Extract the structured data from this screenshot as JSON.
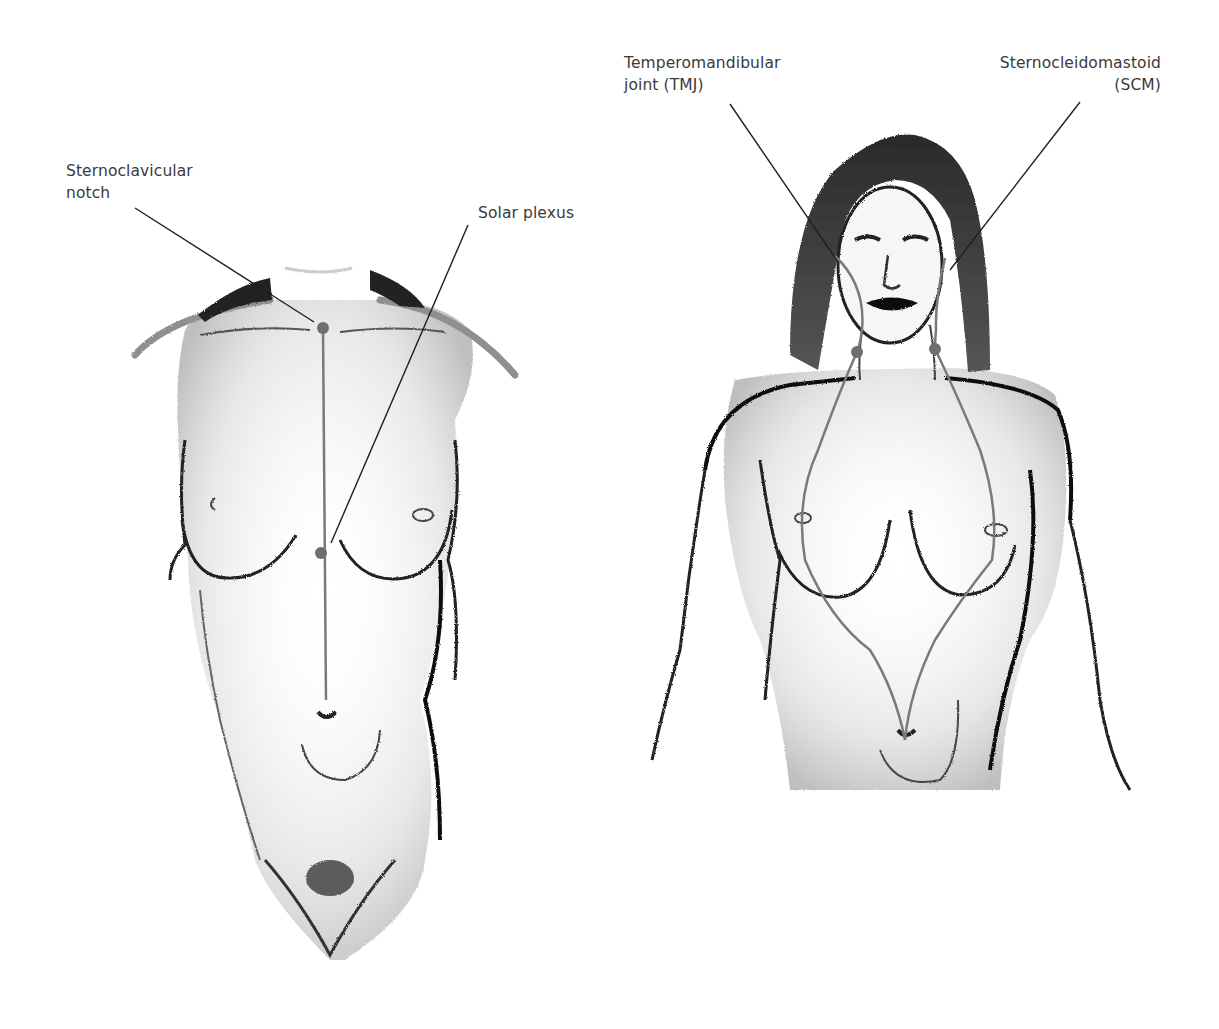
{
  "diagram": {
    "title": "",
    "figures": [
      {
        "id": "torso-front",
        "description": "Front view of a female torso, neck to pelvis",
        "labels": [
          {
            "id": "sternoclavicular-notch",
            "lines": [
              "Sternoclavicular",
              "notch"
            ]
          },
          {
            "id": "solar-plexus",
            "lines": [
              "Solar plexus"
            ]
          }
        ],
        "markers": [
          {
            "id": "notch-dot",
            "x": 323,
            "y": 328
          },
          {
            "id": "solar-plexus-dot",
            "x": 321,
            "y": 553
          }
        ],
        "meridian_line": "vertical line from sternoclavicular notch down past solar plexus to navel"
      },
      {
        "id": "head-torso-front",
        "description": "Front view of a woman with long hair, head to lower abdomen",
        "labels": [
          {
            "id": "tmj",
            "lines": [
              "Temperomandibular",
              "joint (TMJ)"
            ]
          },
          {
            "id": "scm",
            "lines": [
              "Sternocleidomastoid",
              "(SCM)"
            ]
          }
        ],
        "markers": [
          {
            "id": "left-neck-dot",
            "x": 857,
            "y": 352
          },
          {
            "id": "right-neck-dot",
            "x": 935,
            "y": 349
          }
        ],
        "meridian_line": "two curved lines from jaw/TMJ down the neck (SCM) crossing the breasts and converging at the navel"
      }
    ],
    "colors": {
      "label_text": "#3a3a3a",
      "leader_line": "#1e1e1e",
      "meridian_line": "#7a7a7a",
      "marker_dot": "#6f6f6f",
      "figure_outline": "#222222",
      "figure_shading": "#9a9a9a"
    }
  }
}
